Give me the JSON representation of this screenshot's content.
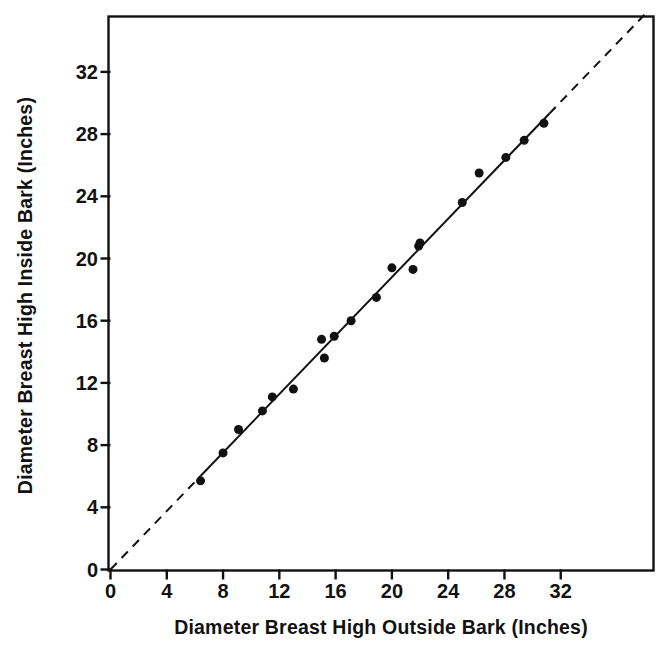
{
  "chart_data": {
    "type": "scatter",
    "title": "",
    "xlabel": "Diameter Breast High Outside Bark (Inches)",
    "ylabel": "Diameter Breast High Inside Bark (Inches)",
    "xlim": [
      0,
      38.5
    ],
    "ylim": [
      0,
      35.5
    ],
    "xticks": [
      0,
      4,
      8,
      12,
      16,
      20,
      24,
      28,
      32
    ],
    "yticks": [
      0,
      4,
      8,
      12,
      16,
      20,
      24,
      28,
      32
    ],
    "xticklabels": [
      "0",
      "4",
      "8",
      "12",
      "16",
      "20",
      "24",
      "28",
      "32"
    ],
    "yticklabels": [
      "0",
      "4",
      "8",
      "12",
      "16",
      "20",
      "24",
      "28",
      "32"
    ],
    "grid": false,
    "legend": null,
    "axis_units": "Inches",
    "marker": {
      "shape": "circle",
      "color": "#111111",
      "size_px": 9
    },
    "points": [
      {
        "x": 6.4,
        "y": 5.7
      },
      {
        "x": 8.0,
        "y": 7.5
      },
      {
        "x": 9.1,
        "y": 9.0
      },
      {
        "x": 10.8,
        "y": 10.2
      },
      {
        "x": 11.5,
        "y": 11.1
      },
      {
        "x": 13.0,
        "y": 11.6
      },
      {
        "x": 15.0,
        "y": 14.8
      },
      {
        "x": 15.2,
        "y": 13.6
      },
      {
        "x": 15.9,
        "y": 15.0
      },
      {
        "x": 17.1,
        "y": 16.0
      },
      {
        "x": 18.9,
        "y": 17.5
      },
      {
        "x": 20.0,
        "y": 19.4
      },
      {
        "x": 21.5,
        "y": 19.3
      },
      {
        "x": 21.9,
        "y": 20.8
      },
      {
        "x": 22.0,
        "y": 21.0
      },
      {
        "x": 25.0,
        "y": 23.6
      },
      {
        "x": 26.2,
        "y": 25.5
      },
      {
        "x": 28.1,
        "y": 26.5
      },
      {
        "x": 29.4,
        "y": 27.6
      },
      {
        "x": 30.8,
        "y": 28.7
      }
    ],
    "fit_line": {
      "style": "solid",
      "color": "#111111",
      "width_px": 2,
      "x_start": 6.4,
      "x_end": 31.2,
      "slope": 0.94,
      "intercept": 0.0,
      "description": "least-squares regression line through the plotted points"
    },
    "extrapolation_lines": [
      {
        "style": "dashed",
        "color": "#111111",
        "width_px": 2,
        "x_start": 0.0,
        "x_end": 6.4,
        "description": "dashed extension of the fitted line down to the origin"
      },
      {
        "style": "dashed",
        "color": "#111111",
        "width_px": 2,
        "x_start": 31.2,
        "x_end": 38.2,
        "description": "dashed extension of the fitted line beyond the largest point"
      }
    ]
  },
  "axes": {
    "frame": {
      "visible": true,
      "color": "#111111"
    },
    "tick_direction_x": "out",
    "tick_direction_y": "out",
    "origin_label": "0"
  }
}
